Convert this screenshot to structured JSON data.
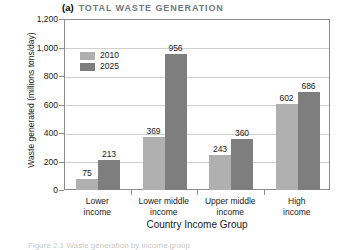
{
  "chart_data": {
    "type": "bar",
    "title": "TOTAL WASTE GENERATION",
    "panel_letter": "(a)",
    "xlabel": "Country Income Group",
    "ylabel": "Waste generated (millions tons/day)",
    "categories": [
      "Lower\nincome",
      "Lower middle\nincome",
      "Upper middle\nincome",
      "High\nincome"
    ],
    "category_lines": [
      [
        "Lower",
        "income"
      ],
      [
        "Lower middle",
        "income"
      ],
      [
        "Upper middle",
        "income"
      ],
      [
        "High",
        "income"
      ]
    ],
    "series": [
      {
        "name": "2010",
        "color": "#b0b0b0",
        "values": [
          75,
          369,
          243,
          602
        ]
      },
      {
        "name": "2025",
        "color": "#7e7e7e",
        "values": [
          213,
          956,
          360,
          686
        ]
      }
    ],
    "ylim": [
      0,
      1200
    ],
    "yticks": [
      0,
      200,
      400,
      600,
      800,
      1000,
      1200
    ],
    "ytick_labels": [
      "0",
      "200",
      "400",
      "600",
      "800",
      "1,000",
      "1,200"
    ],
    "grid": true,
    "legend_position": "upper-left-inside",
    "data_labels": true
  },
  "caption_clipped": "Figure 2.1 Waste generation by income group"
}
